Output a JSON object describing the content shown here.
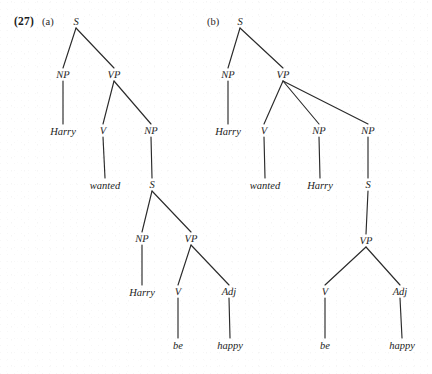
{
  "figure": {
    "example_number": "(27)",
    "type": "syntax-tree-pair",
    "subfigures": [
      {
        "label": "(a)",
        "label_pos": {
          "x": 42,
          "y": 22
        },
        "description": "Binary-branching VP with embedded S complement",
        "nodes": [
          {
            "id": "a-s-top",
            "text": "S",
            "kind": "category",
            "x": 76,
            "y": 22
          },
          {
            "id": "a-np1",
            "text": "NP",
            "kind": "category",
            "x": 63,
            "y": 75
          },
          {
            "id": "a-vp1",
            "text": "VP",
            "kind": "category",
            "x": 114,
            "y": 75
          },
          {
            "id": "a-harry1",
            "text": "Harry",
            "kind": "terminal",
            "x": 63,
            "y": 131
          },
          {
            "id": "a-v1",
            "text": "V",
            "kind": "category",
            "x": 103,
            "y": 131
          },
          {
            "id": "a-np2",
            "text": "NP",
            "kind": "category",
            "x": 151,
            "y": 131
          },
          {
            "id": "a-wanted",
            "text": "wanted",
            "kind": "terminal",
            "x": 105,
            "y": 185
          },
          {
            "id": "a-s2",
            "text": "S",
            "kind": "category",
            "x": 152,
            "y": 185
          },
          {
            "id": "a-np3",
            "text": "NP",
            "kind": "category",
            "x": 142,
            "y": 239
          },
          {
            "id": "a-vp2",
            "text": "VP",
            "kind": "category",
            "x": 191,
            "y": 239
          },
          {
            "id": "a-harry2",
            "text": "Harry",
            "kind": "terminal",
            "x": 142,
            "y": 292
          },
          {
            "id": "a-v2",
            "text": "V",
            "kind": "category",
            "x": 178,
            "y": 292
          },
          {
            "id": "a-adj",
            "text": "Adj",
            "kind": "category",
            "x": 229,
            "y": 292
          },
          {
            "id": "a-be",
            "text": "be",
            "kind": "terminal",
            "x": 178,
            "y": 345
          },
          {
            "id": "a-happy",
            "text": "happy",
            "kind": "terminal",
            "x": 230,
            "y": 345
          }
        ],
        "edges": [
          {
            "from": "a-s-top",
            "to": "a-np1"
          },
          {
            "from": "a-s-top",
            "to": "a-vp1"
          },
          {
            "from": "a-np1",
            "to": "a-harry1"
          },
          {
            "from": "a-vp1",
            "to": "a-v1"
          },
          {
            "from": "a-vp1",
            "to": "a-np2"
          },
          {
            "from": "a-v1",
            "to": "a-wanted"
          },
          {
            "from": "a-np2",
            "to": "a-s2"
          },
          {
            "from": "a-s2",
            "to": "a-np3"
          },
          {
            "from": "a-s2",
            "to": "a-vp2"
          },
          {
            "from": "a-np3",
            "to": "a-harry2"
          },
          {
            "from": "a-vp2",
            "to": "a-v2"
          },
          {
            "from": "a-vp2",
            "to": "a-adj"
          },
          {
            "from": "a-v2",
            "to": "a-be"
          },
          {
            "from": "a-adj",
            "to": "a-happy"
          }
        ]
      },
      {
        "label": "(b)",
        "label_pos": {
          "x": 207,
          "y": 22
        },
        "description": "Ternary-branching VP with NP object plus S complement",
        "nodes": [
          {
            "id": "b-s-top",
            "text": "S",
            "kind": "category",
            "x": 240,
            "y": 22
          },
          {
            "id": "b-np1",
            "text": "NP",
            "kind": "category",
            "x": 228,
            "y": 75
          },
          {
            "id": "b-vp1",
            "text": "VP",
            "kind": "category",
            "x": 283,
            "y": 75
          },
          {
            "id": "b-harry1",
            "text": "Harry",
            "kind": "terminal",
            "x": 228,
            "y": 131
          },
          {
            "id": "b-v1",
            "text": "V",
            "kind": "category",
            "x": 264,
            "y": 131
          },
          {
            "id": "b-np2",
            "text": "NP",
            "kind": "category",
            "x": 319,
            "y": 131
          },
          {
            "id": "b-np3",
            "text": "NP",
            "kind": "category",
            "x": 368,
            "y": 131
          },
          {
            "id": "b-wanted",
            "text": "wanted",
            "kind": "terminal",
            "x": 265,
            "y": 185
          },
          {
            "id": "b-harry2",
            "text": "Harry",
            "kind": "terminal",
            "x": 320,
            "y": 185
          },
          {
            "id": "b-s2",
            "text": "S",
            "kind": "category",
            "x": 368,
            "y": 185
          },
          {
            "id": "b-vp2",
            "text": "VP",
            "kind": "category",
            "x": 366,
            "y": 241
          },
          {
            "id": "b-v2",
            "text": "V",
            "kind": "category",
            "x": 325,
            "y": 292
          },
          {
            "id": "b-adj",
            "text": "Adj",
            "kind": "category",
            "x": 400,
            "y": 292
          },
          {
            "id": "b-be",
            "text": "be",
            "kind": "terminal",
            "x": 325,
            "y": 345
          },
          {
            "id": "b-happy",
            "text": "happy",
            "kind": "terminal",
            "x": 402,
            "y": 345
          }
        ],
        "edges": [
          {
            "from": "b-s-top",
            "to": "b-np1"
          },
          {
            "from": "b-s-top",
            "to": "b-vp1"
          },
          {
            "from": "b-np1",
            "to": "b-harry1"
          },
          {
            "from": "b-vp1",
            "to": "b-v1"
          },
          {
            "from": "b-vp1",
            "to": "b-np2"
          },
          {
            "from": "b-vp1",
            "to": "b-np3"
          },
          {
            "from": "b-v1",
            "to": "b-wanted"
          },
          {
            "from": "b-np2",
            "to": "b-harry2"
          },
          {
            "from": "b-np3",
            "to": "b-s2"
          },
          {
            "from": "b-s2",
            "to": "b-vp2"
          },
          {
            "from": "b-vp2",
            "to": "b-v2"
          },
          {
            "from": "b-vp2",
            "to": "b-adj"
          },
          {
            "from": "b-v2",
            "to": "b-be"
          },
          {
            "from": "b-adj",
            "to": "b-happy"
          }
        ]
      }
    ]
  },
  "style": {
    "ink": "#1c1c1c",
    "line": "#2b2b2b",
    "paper": "#ffffff",
    "line_width": 1.15
  }
}
